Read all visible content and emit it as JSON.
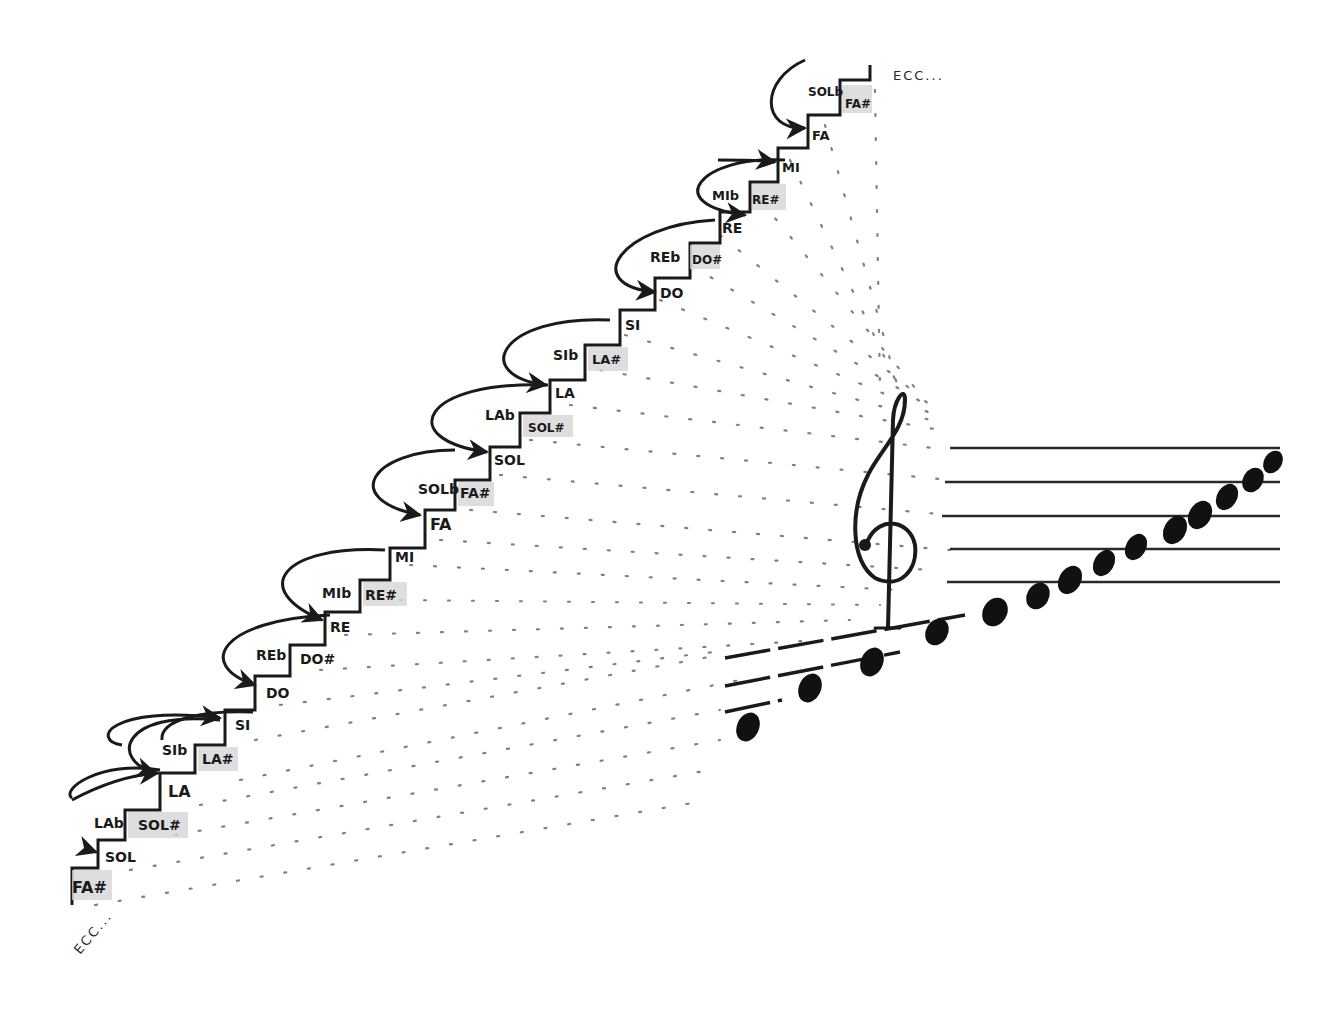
{
  "diagram": {
    "type": "chromatic-staircase",
    "description_visible": "Hand-drawn staircase of chromatic note names leading to a treble clef staff with ascending notes",
    "colors": {
      "ink": "#1a1a1a",
      "dots": "#555555",
      "shade": "#d6d6d6",
      "background": "#ffffff"
    },
    "continuation_top": "ECC...",
    "continuation_bottom": "ECC...",
    "steps": [
      {
        "natural": "FA#",
        "shaded": true
      },
      {
        "natural": "SOL"
      },
      {
        "flat": "LAb",
        "sharp": "SOL#"
      },
      {
        "natural": "LA"
      },
      {
        "flat": "SIb",
        "sharp": "LA#"
      },
      {
        "natural": "SI"
      },
      {
        "natural": "DO"
      },
      {
        "flat": "REb",
        "sharp": "DO#"
      },
      {
        "natural": "RE"
      },
      {
        "flat": "MIb",
        "sharp": "RE#"
      },
      {
        "natural": "MI"
      },
      {
        "natural": "FA"
      },
      {
        "flat": "SOLb",
        "sharp": "FA#"
      },
      {
        "natural": "SOL"
      },
      {
        "flat": "LAb",
        "sharp": "SOL#"
      },
      {
        "natural": "LA"
      },
      {
        "flat": "SIb",
        "sharp": "LA#"
      },
      {
        "natural": "SI"
      },
      {
        "natural": "DO"
      },
      {
        "flat": "REb",
        "sharp": "DO#"
      },
      {
        "natural": "RE"
      },
      {
        "flat": "MIb",
        "sharp": "RE#"
      },
      {
        "natural": "MI"
      },
      {
        "natural": "FA"
      },
      {
        "flat": "SOLb",
        "sharp": "FA#"
      }
    ],
    "labels": {
      "l0": "FA#",
      "l1": "SOL",
      "l2f": "LAb",
      "l2s": "SOL#",
      "l3": "LA",
      "l4f": "SIb",
      "l4s": "LA#",
      "l5": "SI",
      "l6": "DO",
      "l7f": "REb",
      "l7s": "DO#",
      "l8": "RE",
      "l9f": "MIb",
      "l9s": "RE#",
      "l10": "MI",
      "l11": "FA",
      "l12f": "SOLb",
      "l12s": "FA#",
      "l13": "SOL",
      "l14f": "LAb",
      "l14s": "SOL#",
      "l15": "LA",
      "l16f": "SIb",
      "l16s": "LA#",
      "l17": "SI",
      "l18": "DO",
      "l19f": "REb",
      "l19s": "DO#",
      "l20": "RE",
      "l21f": "MIb",
      "l21s": "RE#",
      "l22": "MI",
      "l23": "FA",
      "l24f": "SOLb",
      "l24s": "FA#"
    },
    "staff": {
      "clef": "treble-clef",
      "line_count": 5,
      "ledger_lines_below": 3,
      "note_count": 15
    }
  }
}
